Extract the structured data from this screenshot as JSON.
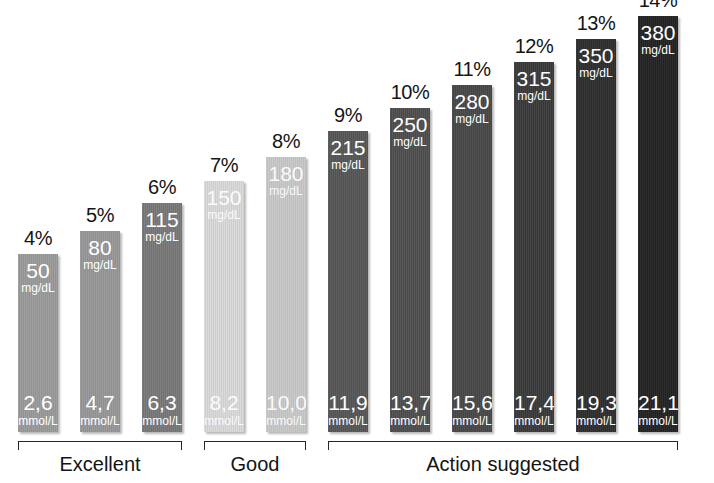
{
  "chart_data": {
    "type": "bar",
    "title": "",
    "subtitle": "",
    "xlabel": "",
    "ylabel": "",
    "grid": false,
    "legend": "none",
    "orientation": "vertical",
    "categories": [
      "4%",
      "5%",
      "6%",
      "7%",
      "8%",
      "9%",
      "10%",
      "11%",
      "12%",
      "13%",
      "14%"
    ],
    "series": [
      {
        "name": "HbA1c (%)",
        "values": [
          4,
          5,
          6,
          7,
          8,
          9,
          10,
          11,
          12,
          13,
          14
        ]
      },
      {
        "name": "Average blood glucose (mg/dL)",
        "values": [
          50,
          80,
          115,
          150,
          180,
          215,
          250,
          280,
          315,
          350,
          380
        ]
      },
      {
        "name": "Average blood glucose (mmol/L)",
        "values": [
          2.6,
          4.7,
          6.3,
          8.2,
          10.0,
          11.9,
          13.7,
          15.6,
          17.4,
          19.3,
          21.1
        ]
      }
    ],
    "units": {
      "top": "mg/dL",
      "bottom": "mmol/L"
    },
    "groups": [
      {
        "label": "Excellent",
        "bar_indices": [
          0,
          1,
          2
        ]
      },
      {
        "label": "Good",
        "bar_indices": [
          3,
          4
        ]
      },
      {
        "label": "Action suggested",
        "bar_indices": [
          5,
          6,
          7,
          8,
          9,
          10
        ]
      }
    ]
  },
  "bars": [
    {
      "pct": "4%",
      "top_value": "50",
      "top_unit": "mg/dL",
      "bottom_value": "2,6",
      "bottom_unit": "mmol/L",
      "color": "#9a9a9a",
      "group": "Excellent",
      "x": 18,
      "top_y": 254
    },
    {
      "pct": "5%",
      "top_value": "80",
      "top_unit": "mg/dL",
      "bottom_value": "4,7",
      "bottom_unit": "mmol/L",
      "color": "#979797",
      "group": "Excellent",
      "x": 80,
      "top_y": 231
    },
    {
      "pct": "6%",
      "top_value": "115",
      "top_unit": "mg/dL",
      "bottom_value": "6,3",
      "bottom_unit": "mmol/L",
      "color": "#787878",
      "group": "Excellent",
      "x": 142,
      "top_y": 203
    },
    {
      "pct": "7%",
      "top_value": "150",
      "top_unit": "mg/dL",
      "bottom_value": "8,2",
      "bottom_unit": "mmol/L",
      "color": "#d9d9d9",
      "group": "Good",
      "x": 204,
      "top_y": 181
    },
    {
      "pct": "8%",
      "top_value": "180",
      "top_unit": "mg/dL",
      "bottom_value": "10,0",
      "bottom_unit": "mmol/L",
      "color": "#c8c8c8",
      "group": "Good",
      "x": 266,
      "top_y": 157
    },
    {
      "pct": "9%",
      "top_value": "215",
      "top_unit": "mg/dL",
      "bottom_value": "11,9",
      "bottom_unit": "mmol/L",
      "color": "#565656",
      "group": "Action suggested",
      "x": 328,
      "top_y": 131
    },
    {
      "pct": "10%",
      "top_value": "250",
      "top_unit": "mg/dL",
      "bottom_value": "13,7",
      "bottom_unit": "mmol/L",
      "color": "#4e4e4e",
      "group": "Action suggested",
      "x": 390,
      "top_y": 108
    },
    {
      "pct": "11%",
      "top_value": "280",
      "top_unit": "mg/dL",
      "bottom_value": "15,6",
      "bottom_unit": "mmol/L",
      "color": "#484848",
      "group": "Action suggested",
      "x": 452,
      "top_y": 85
    },
    {
      "pct": "12%",
      "top_value": "315",
      "top_unit": "mg/dL",
      "bottom_value": "17,4",
      "bottom_unit": "mmol/L",
      "color": "#3a3a3a",
      "group": "Action suggested",
      "x": 514,
      "top_y": 62
    },
    {
      "pct": "13%",
      "top_value": "350",
      "top_unit": "mg/dL",
      "bottom_value": "19,3",
      "bottom_unit": "mmol/L",
      "color": "#2e2e2e",
      "group": "Action suggested",
      "x": 576,
      "top_y": 39
    },
    {
      "pct": "14%",
      "top_value": "380",
      "top_unit": "mg/dL",
      "bottom_value": "21,1",
      "bottom_unit": "mmol/L",
      "color": "#232323",
      "group": "Action suggested",
      "x": 638,
      "top_y": 16
    }
  ],
  "groups": [
    {
      "label": "Excellent",
      "x": 18,
      "width": 164
    },
    {
      "label": "Good",
      "x": 204,
      "width": 102
    },
    {
      "label": "Action suggested",
      "x": 328,
      "width": 350
    }
  ],
  "colors": {
    "background": "#ffffff",
    "text": "#141414",
    "bar_text": "#ffffff",
    "bracket": "#262626"
  }
}
